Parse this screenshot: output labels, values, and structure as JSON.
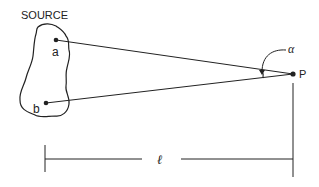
{
  "diagram": {
    "source_label": "SOURCE",
    "point_a_label": "a",
    "point_b_label": "b",
    "point_p_label": "P",
    "angle_label": "α",
    "distance_label": "ℓ",
    "stroke_color": "#222222",
    "background": "#ffffff"
  }
}
